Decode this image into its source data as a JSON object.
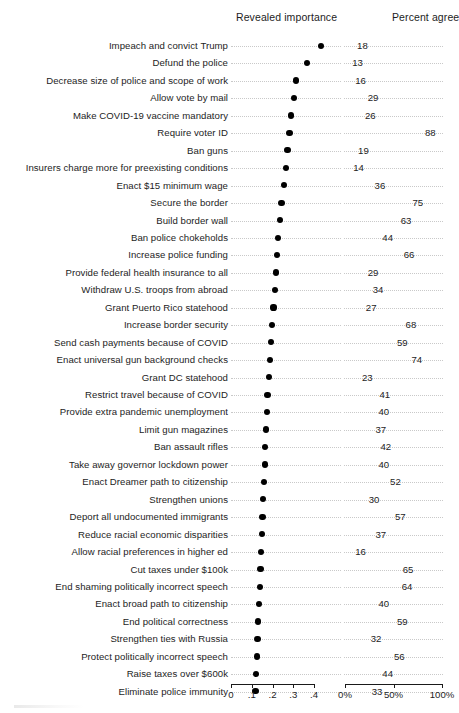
{
  "header": {
    "left_column": "Revealed importance",
    "right_column": "Percent agree"
  },
  "axes": {
    "left": {
      "ticks": [
        0,
        0.1,
        0.2,
        0.3,
        0.4
      ],
      "tick_labels": [
        "0",
        ".1",
        ".2",
        ".3",
        ".4"
      ],
      "min": 0,
      "max": 0.4
    },
    "right": {
      "ticks": [
        0,
        50,
        100
      ],
      "tick_labels": [
        "0%",
        "50%",
        "100%"
      ],
      "min": 0,
      "max": 100
    }
  },
  "chart_data": {
    "type": "scatter",
    "title": "",
    "subtitle": "",
    "xlabel": "",
    "ylabel": "",
    "grid": "dotted-row-guides",
    "legend": "none",
    "panels": [
      {
        "name": "Revealed importance",
        "xlim": [
          0,
          0.4
        ],
        "ticks": [
          0,
          0.1,
          0.2,
          0.3,
          0.4
        ],
        "tick_labels": [
          "0",
          ".1",
          ".2",
          ".3",
          ".4"
        ]
      },
      {
        "name": "Percent agree",
        "xlim": [
          0,
          100
        ],
        "ticks": [
          0,
          50,
          100
        ],
        "tick_labels": [
          "0%",
          "50%",
          "100%"
        ]
      }
    ],
    "categories": [
      "Impeach and convict Trump",
      "Defund the police",
      "Decrease size of police and scope of work",
      "Allow vote by mail",
      "Make COVID-19 vaccine mandatory",
      "Require voter ID",
      "Ban guns",
      "Insurers charge more for preexisting conditions",
      "Enact $15 minimum wage",
      "Secure the border",
      "Build border wall",
      "Ban police chokeholds",
      "Increase police funding",
      "Provide federal health insurance to all",
      "Withdraw U.S. troops from abroad",
      "Grant Puerto Rico statehood",
      "Increase border security",
      "Send cash payments because of COVID",
      "Enact universal gun background checks",
      "Grant DC statehood",
      "Restrict travel because of COVID",
      "Provide extra pandemic unemployment",
      "Limit gun magazines",
      "Ban assault rifles",
      "Take away governor lockdown power",
      "Enact Dreamer path to citizenship",
      "Strengthen unions",
      "Deport all undocumented immigrants",
      "Reduce racial economic disparities",
      "Allow racial preferences in higher ed",
      "Cut taxes under $100k",
      "End shaming politically incorrect speech",
      "Enact broad path to citizenship",
      "End political correctness",
      "Strengthen ties with Russia",
      "Protect politically incorrect speech",
      "Raise taxes over $600k",
      "Eliminate police immunity"
    ],
    "series": [
      {
        "name": "Revealed importance",
        "panel": 0,
        "values": [
          0.432,
          0.368,
          0.315,
          0.305,
          0.288,
          0.282,
          0.272,
          0.266,
          0.256,
          0.243,
          0.236,
          0.228,
          0.222,
          0.216,
          0.212,
          0.205,
          0.198,
          0.192,
          0.186,
          0.182,
          0.176,
          0.172,
          0.168,
          0.165,
          0.162,
          0.16,
          0.156,
          0.152,
          0.148,
          0.145,
          0.142,
          0.138,
          0.136,
          0.132,
          0.128,
          0.124,
          0.12,
          0.118
        ]
      },
      {
        "name": "Percent agree",
        "panel": 1,
        "values": [
          18,
          13,
          16,
          29,
          26,
          88,
          19,
          14,
          36,
          75,
          63,
          44,
          66,
          29,
          34,
          27,
          68,
          59,
          74,
          23,
          41,
          40,
          37,
          42,
          40,
          52,
          30,
          57,
          37,
          16,
          65,
          64,
          40,
          59,
          32,
          56,
          44,
          33
        ]
      }
    ]
  }
}
